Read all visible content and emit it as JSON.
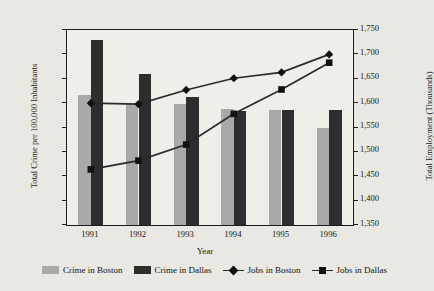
{
  "chart_data": {
    "type": "bar",
    "title": "",
    "xlabel": "Year",
    "ylabel": "Total Crime per 100,000 Inhabitants",
    "y2label": "Total Employment (Thousands)",
    "categories": [
      "1991",
      "1992",
      "1993",
      "1994",
      "1995",
      "1996"
    ],
    "ylim": [
      0,
      16000
    ],
    "ytick_step": 2000,
    "yticks": [
      "16,000",
      "14,000",
      "12,000",
      "10,000",
      "8,000",
      "6,000",
      "4,000",
      "2,000",
      "0"
    ],
    "ytick_values": [
      16000,
      14000,
      12000,
      10000,
      8000,
      6000,
      4000,
      2000,
      0
    ],
    "y2lim": [
      1350,
      1750
    ],
    "y2tick_step": 50,
    "y2ticks": [
      "1,750",
      "1,700",
      "1,650",
      "1,600",
      "1,550",
      "1,500",
      "1,450",
      "1,400",
      "1,350"
    ],
    "y2tick_values": [
      1750,
      1700,
      1650,
      1600,
      1550,
      1500,
      1450,
      1400,
      1350
    ],
    "grid": false,
    "legend_position": "bottom",
    "series": [
      {
        "name": "Crime in Boston",
        "kind": "bar",
        "axis": "left",
        "color": "#a9a9a7",
        "values": [
          10650,
          9950,
          9950,
          9500,
          9400,
          8000
        ]
      },
      {
        "name": "Crime in Dallas",
        "kind": "bar",
        "axis": "left",
        "color": "#2d2d2d",
        "values": [
          15150,
          12400,
          10500,
          9350,
          9400,
          9400
        ]
      },
      {
        "name": "Jobs in Boston",
        "kind": "line",
        "axis": "right",
        "marker": "diamond",
        "color": "#2b2b2b",
        "values": [
          1600,
          1598,
          1627,
          1651,
          1663,
          1700
        ]
      },
      {
        "name": "Jobs in Dallas",
        "kind": "line",
        "axis": "right",
        "marker": "square",
        "color": "#2b2b2b",
        "values": [
          1464,
          1482,
          1515,
          1578,
          1628,
          1683
        ]
      }
    ]
  },
  "legend": {
    "items": [
      {
        "label": "Crime in Boston",
        "icon": "legend-swatch-light"
      },
      {
        "label": "Crime in Dallas",
        "icon": "legend-swatch-dark"
      },
      {
        "label": "Jobs in Boston",
        "icon": "legend-line-diamond"
      },
      {
        "label": "Jobs in Dallas",
        "icon": "legend-line-square"
      }
    ]
  },
  "colors": {
    "bar_boston": "#a9a9a7",
    "bar_dallas": "#2d2d2d",
    "line": "#2b2b2b",
    "plot_background": "#efeee9",
    "figure_background": "#e9e8e2",
    "axis": "#1c1c1c"
  }
}
